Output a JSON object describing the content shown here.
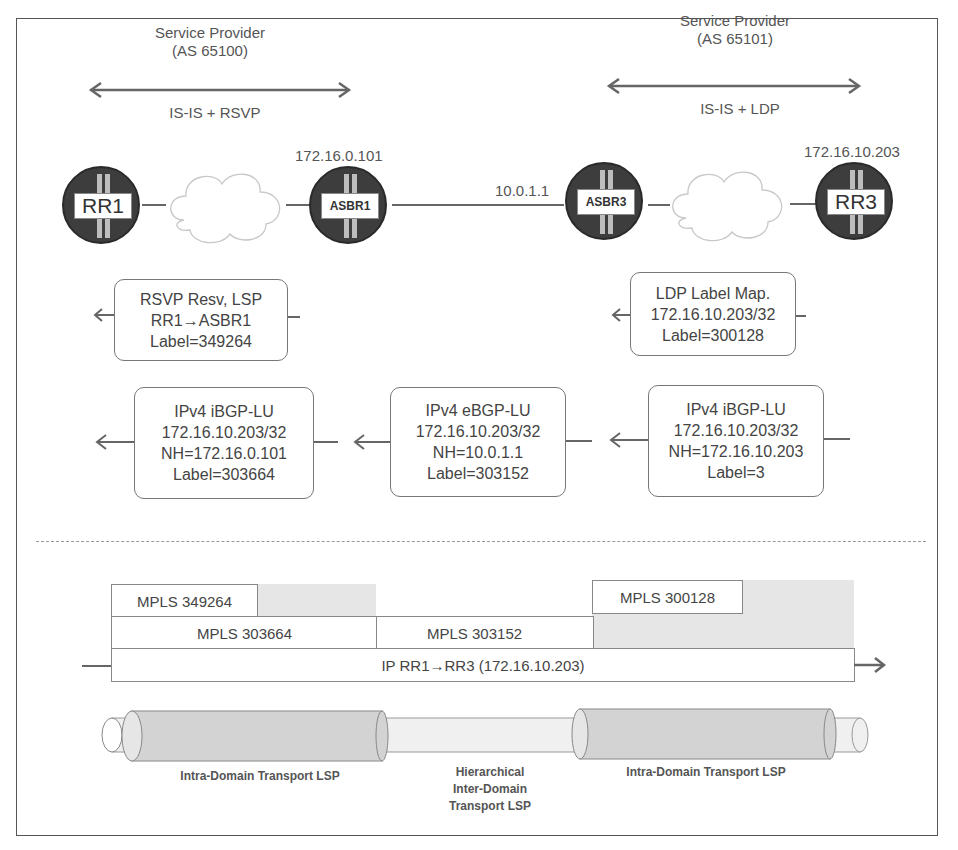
{
  "domains": [
    {
      "title_line1": "Service Provider",
      "title_line2": "(AS 65100)",
      "protocols": "IS-IS + RSVP"
    },
    {
      "title_line1": "Service Provider",
      "title_line2": "(AS 65101)",
      "protocols": "IS-IS + LDP"
    }
  ],
  "routers": [
    {
      "name": "RR1",
      "ip": ""
    },
    {
      "name": "ASBR1",
      "ip": "172.16.0.101"
    },
    {
      "name": "ASBR3",
      "ip": "10.0.1.1"
    },
    {
      "name": "RR3",
      "ip": "172.16.10.203"
    }
  ],
  "signaling": {
    "rsvp": {
      "line1": "RSVP Resv, LSP",
      "line2": "RR1→ASBR1",
      "line3": "Label=349264"
    },
    "ldp": {
      "line1": "LDP Label Map.",
      "line2": "172.16.10.203/32",
      "line3": "Label=300128"
    },
    "bgp": [
      {
        "line1": "IPv4 iBGP-LU",
        "line2": "172.16.10.203/32",
        "line3": "NH=172.16.0.101",
        "line4": "Label=303664"
      },
      {
        "line1": "IPv4 eBGP-LU",
        "line2": "172.16.10.203/32",
        "line3": "NH=10.0.1.1",
        "line4": "Label=303152"
      },
      {
        "line1": "IPv4 iBGP-LU",
        "line2": "172.16.10.203/32",
        "line3": "NH=172.16.10.203",
        "line4": "Label=3"
      }
    ]
  },
  "packet": {
    "top_left": "MPLS 349264",
    "top_right": "MPLS 300128",
    "mid_left": "MPLS 303664",
    "mid_center": "MPLS 303152",
    "payload": "IP RR1→RR3 (172.16.10.203)"
  },
  "lsps": {
    "left": "Intra-Domain Transport LSP",
    "center_line1": "Hierarchical",
    "center_line2": "Inter-Domain",
    "center_line3": "Transport LSP",
    "right": "Intra-Domain Transport LSP"
  }
}
